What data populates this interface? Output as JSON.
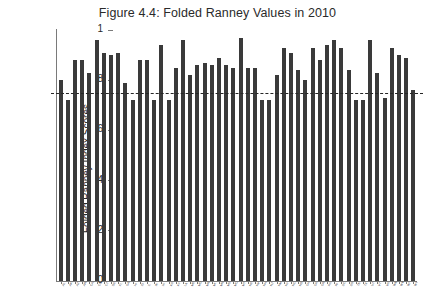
{
  "figure": {
    "title": "Figure 4.4: Folded Ranney Values in 2010"
  },
  "axes": {
    "ylabel": "Folded Ranney Index Scores",
    "yticks": [
      "0",
      ".2",
      ".4",
      ".6",
      ".8",
      "1"
    ],
    "xlabel": ""
  },
  "chart_data": {
    "type": "bar",
    "title": "Figure 4.4: Folded Ranney Values in 2010",
    "xlabel": "",
    "ylabel": "Folded Ranney Index Scores",
    "ylim": [
      0,
      1
    ],
    "ytick_values": [
      0,
      0.2,
      0.4,
      0.6,
      0.8,
      1
    ],
    "ytick_labels": [
      "0",
      ".2",
      ".4",
      ".6",
      ".8",
      "1"
    ],
    "grid": false,
    "legend": null,
    "bar_color": "#3a3a3a",
    "annotations": [
      {
        "type": "horizontal-reference-line",
        "value": 0.75,
        "style": "dashed",
        "color": "#262626"
      }
    ],
    "categories": [
      "AL",
      "AK",
      "AZ",
      "AR",
      "CA",
      "CO",
      "CT",
      "DE",
      "FL",
      "GA",
      "HI",
      "ID",
      "IL",
      "IN",
      "IA",
      "KS",
      "KY",
      "LA",
      "ME",
      "MD",
      "MA",
      "MI",
      "MN",
      "MS",
      "MO",
      "MT",
      "NE",
      "NV",
      "NH",
      "NJ",
      "NM",
      "NY",
      "NC",
      "ND",
      "OH",
      "OK",
      "OR",
      "PA",
      "RI",
      "SC",
      "SD",
      "TN",
      "TX",
      "UT",
      "VT",
      "VA",
      "WA",
      "WV",
      "WI",
      "WY"
    ],
    "values": [
      0.8,
      0.72,
      0.88,
      0.88,
      0.83,
      0.96,
      0.91,
      0.9,
      0.91,
      0.79,
      0.72,
      0.88,
      0.88,
      0.72,
      0.94,
      0.72,
      0.85,
      0.96,
      0.82,
      0.86,
      0.87,
      0.86,
      0.89,
      0.86,
      0.85,
      0.97,
      0.85,
      0.85,
      0.72,
      0.72,
      0.82,
      0.93,
      0.91,
      0.84,
      0.8,
      0.93,
      0.88,
      0.94,
      0.96,
      0.93,
      0.84,
      0.72,
      0.72,
      0.96,
      0.83,
      0.73,
      0.93,
      0.9,
      0.89,
      0.76
    ]
  }
}
